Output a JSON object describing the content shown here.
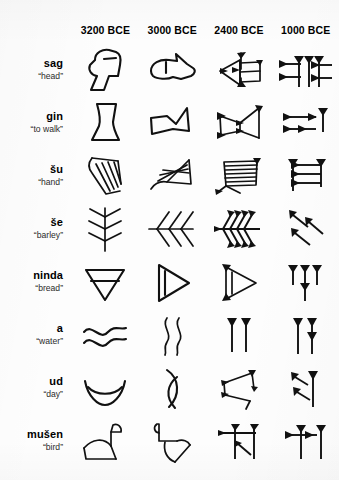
{
  "figure": {
    "kind": "cuneiform-evolution-table",
    "accent_color": "#111111",
    "background_color": "#fdfdfd"
  },
  "header": {
    "label_column": "",
    "eras": [
      {
        "id": "e3200",
        "label": "3200 BCE"
      },
      {
        "id": "e3000",
        "label": "3000 BCE"
      },
      {
        "id": "e2400",
        "label": "2400 BCE"
      },
      {
        "id": "e1000",
        "label": "1000 BCE"
      }
    ]
  },
  "rows": [
    {
      "id": "sag",
      "word": "sag",
      "gloss": "“head”",
      "signs": [
        {
          "era": "3200 BCE",
          "name": "head-profile-pictograph"
        },
        {
          "era": "3000 BCE",
          "name": "head-rotated-outline"
        },
        {
          "era": "2400 BCE",
          "name": "head-linear-wedge-frame"
        },
        {
          "era": "1000 BCE",
          "name": "head-cuneiform-wedges"
        }
      ]
    },
    {
      "id": "gin",
      "word": "gin",
      "gloss": "“to walk”",
      "signs": [
        {
          "era": "3200 BCE",
          "name": "foot-pictograph"
        },
        {
          "era": "3000 BCE",
          "name": "foot-rotated-bowtie"
        },
        {
          "era": "2400 BCE",
          "name": "walk-bowtie-wedge-frame"
        },
        {
          "era": "1000 BCE",
          "name": "walk-cuneiform-wedges"
        }
      ]
    },
    {
      "id": "su",
      "word": "šu",
      "gloss": "“hand”",
      "signs": [
        {
          "era": "3200 BCE",
          "name": "hand-fingers-pictograph"
        },
        {
          "era": "3000 BCE",
          "name": "hand-rotated-strokes"
        },
        {
          "era": "2400 BCE",
          "name": "hand-ruled-box-wedge"
        },
        {
          "era": "1000 BCE",
          "name": "hand-cuneiform-wedges"
        }
      ]
    },
    {
      "id": "se",
      "word": "še",
      "gloss": "“barley”",
      "signs": [
        {
          "era": "3200 BCE",
          "name": "barley-ear-pictograph"
        },
        {
          "era": "3000 BCE",
          "name": "barley-rotated-chevrons"
        },
        {
          "era": "2400 BCE",
          "name": "barley-wedge-chevrons"
        },
        {
          "era": "1000 BCE",
          "name": "barley-cuneiform-wedges"
        }
      ]
    },
    {
      "id": "ninda",
      "word": "ninda",
      "gloss": "“bread”",
      "signs": [
        {
          "era": "3200 BCE",
          "name": "bread-down-triangle-pictograph"
        },
        {
          "era": "3000 BCE",
          "name": "bread-right-triangle"
        },
        {
          "era": "2400 BCE",
          "name": "bread-triangle-wedge-frame"
        },
        {
          "era": "1000 BCE",
          "name": "bread-cuneiform-wedges"
        }
      ]
    },
    {
      "id": "a",
      "word": "a",
      "gloss": "“water”",
      "signs": [
        {
          "era": "3200 BCE",
          "name": "water-horizontal-waves"
        },
        {
          "era": "3000 BCE",
          "name": "water-vertical-waves"
        },
        {
          "era": "2400 BCE",
          "name": "water-two-vertical-wedges"
        },
        {
          "era": "1000 BCE",
          "name": "water-cuneiform-wedges"
        }
      ]
    },
    {
      "id": "ud",
      "word": "ud",
      "gloss": "“day”",
      "signs": [
        {
          "era": "3200 BCE",
          "name": "day-sun-over-horizon-pictograph"
        },
        {
          "era": "3000 BCE",
          "name": "day-rotated-crescent"
        },
        {
          "era": "2400 BCE",
          "name": "day-angular-wedge-frame"
        },
        {
          "era": "1000 BCE",
          "name": "day-cuneiform-wedges"
        }
      ]
    },
    {
      "id": "musen",
      "word": "mušen",
      "gloss": "“bird”",
      "signs": [
        {
          "era": "3200 BCE",
          "name": "bird-pictograph"
        },
        {
          "era": "3000 BCE",
          "name": "bird-rotated-outline"
        },
        {
          "era": "2400 BCE",
          "name": "bird-wedge-frame"
        },
        {
          "era": "1000 BCE",
          "name": "bird-cuneiform-wedges"
        }
      ]
    }
  ]
}
